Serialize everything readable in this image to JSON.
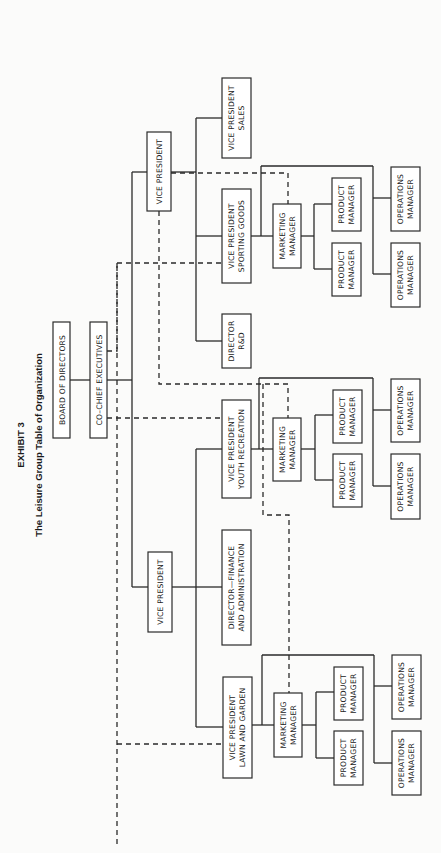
{
  "title": {
    "exhibit": "EXHIBIT 3",
    "subtitle": "The Leisure Group Table of Organization"
  },
  "nodes": {
    "board": [
      "BOARD OF DIRECTORS"
    ],
    "cochief": [
      "CO–CHIEF EXECUTIVES"
    ],
    "vp_top": [
      "VICE PRESIDENT"
    ],
    "vp_bottom": [
      "VICE PRESIDENT"
    ],
    "vp_sales": [
      "VICE PRESIDENT",
      "SALES"
    ],
    "vp_sporting": [
      "VICE PRESIDENT",
      "SPORTING GOODS"
    ],
    "dir_rd": [
      "DIRECTOR",
      "R&D"
    ],
    "vp_youth": [
      "VICE PRESIDENT",
      "YOUTH RECREATION"
    ],
    "dir_finance": [
      "DIRECTOR—FINANCE",
      "AND ADMINISTRATION"
    ],
    "vp_lawn": [
      "VICE PRESIDENT",
      "LAWN AND GARDEN"
    ],
    "mm_sporting": [
      "MARKETING",
      "MANAGER"
    ],
    "mm_youth": [
      "MARKETING",
      "MANAGER"
    ],
    "mm_lawn": [
      "MARKETING",
      "MANAGER"
    ],
    "pm_sporting_1": [
      "PRODUCT",
      "MANAGER"
    ],
    "pm_sporting_2": [
      "PRODUCT",
      "MANAGER"
    ],
    "pm_youth_1": [
      "PRODUCT",
      "MANAGER"
    ],
    "pm_youth_2": [
      "PRODUCT",
      "MANAGER"
    ],
    "pm_lawn_1": [
      "PRODUCT",
      "MANAGER"
    ],
    "pm_lawn_2": [
      "PRODUCT",
      "MANAGER"
    ],
    "om_sporting_1": [
      "OPERATIONS",
      "MANAGER"
    ],
    "om_sporting_2": [
      "OPERATIONS",
      "MANAGER"
    ],
    "om_youth_1": [
      "OPERATIONS",
      "MANAGER"
    ],
    "om_youth_2": [
      "OPERATIONS",
      "MANAGER"
    ],
    "om_lawn_1": [
      "OPERATIONS",
      "MANAGER"
    ],
    "om_lawn_2": [
      "OPERATIONS",
      "MANAGER"
    ]
  },
  "legend": {
    "solid_line": "direct reporting",
    "dashed_line": "dotted-line relationship"
  },
  "colors": {
    "line": "#2a2a2a",
    "background": "#fbfbfa"
  }
}
